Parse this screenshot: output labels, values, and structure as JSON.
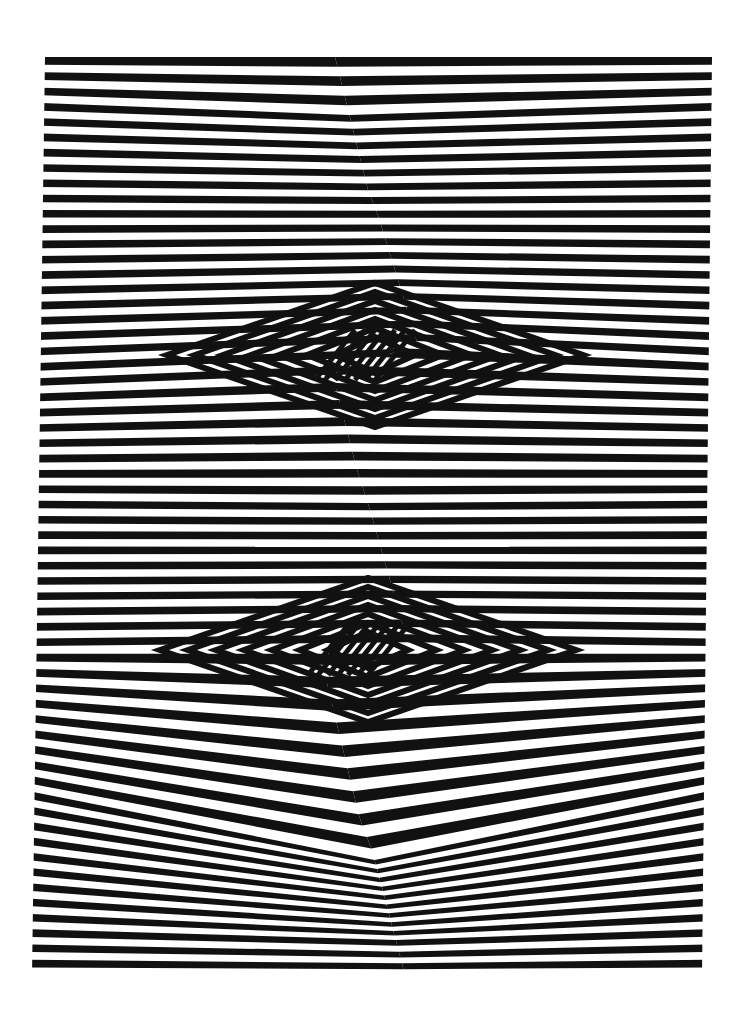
{
  "artwork": {
    "style": "op-art black and white radiating stripes",
    "colors": {
      "background": "#ffffff",
      "stripe": "#111111"
    },
    "frame": {
      "top_left": [
        45,
        57
      ],
      "top_right": [
        712,
        57
      ],
      "bottom_right": [
        702,
        975
      ],
      "bottom_left": [
        32,
        975
      ]
    },
    "fold_line": [
      [
        335,
        57
      ],
      [
        368,
        190
      ],
      [
        378,
        215
      ],
      [
        418,
        345
      ],
      [
        332,
        372
      ],
      [
        357,
        470
      ],
      [
        370,
        510
      ],
      [
        410,
        650
      ],
      [
        325,
        675
      ],
      [
        360,
        820
      ],
      [
        372,
        850
      ],
      [
        405,
        975
      ]
    ],
    "diamond_centers": [
      [
        375,
        355
      ],
      [
        368,
        650
      ]
    ],
    "band_rows": [
      100,
      500,
      930
    ],
    "stripe_count_per_edge": 46
  }
}
